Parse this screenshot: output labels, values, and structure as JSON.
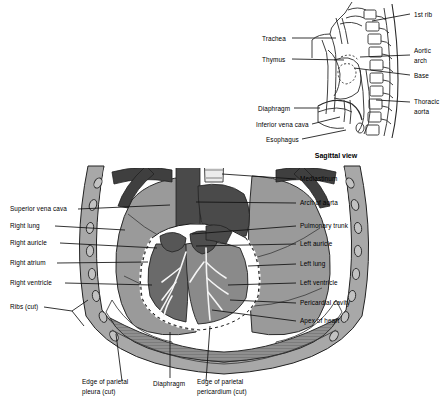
{
  "figure": {
    "title_visible": false,
    "main_view_name": "anterior-thoracic-cavity",
    "inset_caption": "Sagittal view"
  },
  "colors": {
    "background": "#ffffff",
    "outline": "#1a1a1a",
    "lung": "#9a9a9a",
    "lung_dark": "#8c8c8c",
    "heart": "#6e6e6e",
    "great_vessel": "#4a4a4a",
    "vessel_dark": "#3c3c3c",
    "chest_wall": "#a8a8a8",
    "rib": "#b8b8b8",
    "diaphragm": "#8f8f8f",
    "pericardial_cavity": "#ffffff",
    "coronary": "#f2f2f2",
    "label_text": "#000000"
  },
  "main_labels_left": [
    {
      "id": "superior-vena-cava",
      "text": "Superior vena cava",
      "x": 10,
      "y": 211,
      "lead_to_x": 170,
      "lead_to_y": 205
    },
    {
      "id": "right-lung",
      "text": "Right lung",
      "x": 10,
      "y": 228,
      "lead_to_x": 125,
      "lead_to_y": 230
    },
    {
      "id": "right-auricle",
      "text": "Right auricle",
      "x": 10,
      "y": 245,
      "lead_to_x": 157,
      "lead_to_y": 248
    },
    {
      "id": "right-atrium",
      "text": "Right atrium",
      "x": 10,
      "y": 265,
      "lead_to_x": 148,
      "lead_to_y": 262
    },
    {
      "id": "right-ventricle",
      "text": "Right ventricle",
      "x": 10,
      "y": 285,
      "lead_to_x": 152,
      "lead_to_y": 285
    },
    {
      "id": "ribs-cut",
      "text": "Ribs (cut)",
      "x": 10,
      "y": 309,
      "lead_to_x": 78,
      "lead_to_y": 312
    }
  ],
  "main_labels_right": [
    {
      "id": "mediastinum",
      "text": "Mediastinum",
      "x": 300,
      "y": 181,
      "lead_to_x": 222,
      "lead_to_y": 174
    },
    {
      "id": "arch-of-aorta",
      "text": "Arch of aorta",
      "x": 300,
      "y": 205,
      "lead_to_x": 196,
      "lead_to_y": 202
    },
    {
      "id": "pulmonary-trunk",
      "text": "Pulmonary trunk",
      "x": 300,
      "y": 228,
      "lead_to_x": 193,
      "lead_to_y": 232
    },
    {
      "id": "left-auricle",
      "text": "Left auricle",
      "x": 300,
      "y": 246,
      "lead_to_x": 191,
      "lead_to_y": 246
    },
    {
      "id": "left-lung",
      "text": "Left lung",
      "x": 300,
      "y": 266,
      "lead_to_x": 243,
      "lead_to_y": 266
    },
    {
      "id": "left-ventricle",
      "text": "Left ventricle",
      "x": 300,
      "y": 285,
      "lead_to_x": 222,
      "lead_to_y": 285
    },
    {
      "id": "pericardial-cavity",
      "text": "Pericardial cavity",
      "x": 300,
      "y": 305,
      "lead_to_x": 228,
      "lead_to_y": 300
    },
    {
      "id": "apex-of-heart",
      "text": "Apex of heart",
      "x": 300,
      "y": 323,
      "lead_to_x": 214,
      "lead_to_y": 311
    }
  ],
  "main_labels_bottom": [
    {
      "id": "diaphragm",
      "text": "Diaphragm",
      "x": 155,
      "y": 386,
      "lead_to_x": 170,
      "lead_to_y": 332
    },
    {
      "id": "edge-of-parietal-pleura-cut",
      "line1": "Edge of parietal",
      "line2": "pleura (cut)",
      "x": 105,
      "y": 389,
      "lead_to_x": 112,
      "lead_to_y": 335
    },
    {
      "id": "edge-of-parietal-pericardium-cut",
      "line1": "Edge of parietal",
      "line2": "pericardium (cut)",
      "x": 197,
      "y": 389,
      "lead_to_x": 209,
      "lead_to_y": 325
    }
  ],
  "inset_labels_left": [
    {
      "id": "trachea",
      "text": "Trachea",
      "x": 264,
      "y": 40,
      "lead_to_x": 337,
      "lead_to_y": 40
    },
    {
      "id": "thymus",
      "text": "Thymus",
      "x": 264,
      "y": 61,
      "lead_to_x": 345,
      "lead_to_y": 61
    },
    {
      "id": "diaphragm-inset",
      "text": "Diaphragm",
      "x": 258,
      "y": 110,
      "lead_to_x": 318,
      "lead_to_y": 110
    },
    {
      "id": "inferior-vena-cava",
      "text": "Inferior vena cava",
      "x": 252,
      "y": 126,
      "lead_to_x": 340,
      "lead_to_y": 118
    },
    {
      "id": "esophagus",
      "text": "Esophagus",
      "x": 266,
      "y": 141,
      "lead_to_x": 347,
      "lead_to_y": 131
    }
  ],
  "inset_labels_right": [
    {
      "id": "first-rib",
      "text": "1st rib",
      "x": 414,
      "y": 16,
      "lead_to_x": 372,
      "lead_to_y": 22
    },
    {
      "id": "aortic-arch",
      "line1": "Aortic",
      "line2": "arch",
      "x": 414,
      "y": 53,
      "lead_to_x": 360,
      "lead_to_y": 57
    },
    {
      "id": "base",
      "text": "Base",
      "x": 414,
      "y": 77,
      "lead_to_x": 355,
      "lead_to_y": 69
    },
    {
      "id": "thoracic-aorta",
      "line1": "Thoracic",
      "line2": "aorta",
      "x": 414,
      "y": 104,
      "lead_to_x": 374,
      "lead_to_y": 102
    }
  ],
  "anatomy_structures": {
    "main": [
      "chest-wall",
      "ribs",
      "right-lung",
      "left-lung",
      "heart",
      "pericardium",
      "diaphragm",
      "trachea",
      "great-vessels",
      "coronary-vessels"
    ],
    "inset": [
      "sternum",
      "vertebral-column",
      "ribs",
      "trachea",
      "thymus",
      "heart",
      "diaphragm",
      "aorta",
      "esophagus",
      "inferior-vena-cava"
    ]
  }
}
